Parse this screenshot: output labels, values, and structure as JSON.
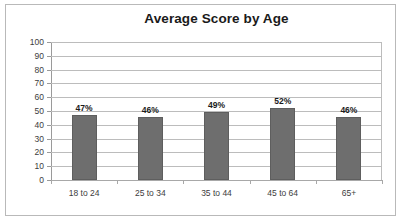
{
  "chart_data": {
    "type": "bar",
    "title": "Average Score by Age",
    "xlabel": "",
    "ylabel": "",
    "categories": [
      "18 to 24",
      "25 to 34",
      "35 to 44",
      "45 to 64",
      "65+"
    ],
    "values": [
      47,
      46,
      49,
      52,
      46
    ],
    "data_labels": [
      "47%",
      "46%",
      "49%",
      "52%",
      "46%"
    ],
    "ylim": [
      0,
      100
    ],
    "ytick_step": 10,
    "ytick_labels": [
      "100",
      "90",
      "80",
      "70",
      "60",
      "50",
      "40",
      "30",
      "20",
      "10",
      "0"
    ],
    "grid": true,
    "legend": false,
    "legend_position": "none",
    "series": [
      {
        "name": "Average Score",
        "values": [
          47,
          46,
          49,
          52,
          46
        ]
      }
    ],
    "colors": {
      "bar_fill": "#6e6e6e",
      "bar_border": "#5e5e5e",
      "gridline": "#bcbcbc",
      "axis_line": "#9a9a9a",
      "frame_border": "#b9b9b9",
      "title_text": "#1a1a1a",
      "tick_text": "#3d3d3d",
      "plot_background": "#ffffff"
    }
  }
}
